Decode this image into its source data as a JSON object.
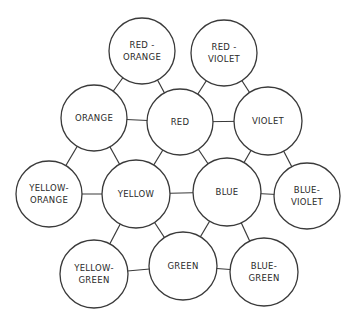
{
  "diagram": {
    "type": "color-wheel-hex-graph",
    "nodes": [
      {
        "id": "red-orange",
        "lines": [
          "RED -",
          "ORANGE"
        ],
        "cx": 142,
        "cy": 51,
        "r": 33
      },
      {
        "id": "red-violet",
        "lines": [
          "RED -",
          "VIOLET"
        ],
        "cx": 224,
        "cy": 53,
        "r": 33
      },
      {
        "id": "orange",
        "lines": [
          "ORANGE"
        ],
        "cx": 94,
        "cy": 118,
        "r": 33
      },
      {
        "id": "red",
        "lines": [
          "RED"
        ],
        "cx": 180,
        "cy": 122,
        "r": 33
      },
      {
        "id": "violet",
        "lines": [
          "VIOLET"
        ],
        "cx": 268,
        "cy": 121,
        "r": 34
      },
      {
        "id": "yellow-orange",
        "lines": [
          "YELLOW-",
          "ORANGE"
        ],
        "cx": 49,
        "cy": 194,
        "r": 33
      },
      {
        "id": "yellow",
        "lines": [
          "YELLOW"
        ],
        "cx": 136,
        "cy": 194,
        "r": 34
      },
      {
        "id": "blue",
        "lines": [
          "BLUE"
        ],
        "cx": 227,
        "cy": 192,
        "r": 34
      },
      {
        "id": "blue-violet",
        "lines": [
          "BLUE-",
          "VIOLET"
        ],
        "cx": 307,
        "cy": 196,
        "r": 33
      },
      {
        "id": "yellow-green",
        "lines": [
          "YELLOW-",
          "GREEN"
        ],
        "cx": 94,
        "cy": 274,
        "r": 34
      },
      {
        "id": "green",
        "lines": [
          "GREEN"
        ],
        "cx": 183,
        "cy": 266,
        "r": 34
      },
      {
        "id": "blue-green",
        "lines": [
          "BLUE-",
          "GREEN"
        ],
        "cx": 264,
        "cy": 272,
        "r": 34
      }
    ],
    "edges": [
      [
        "red-orange",
        "orange"
      ],
      [
        "red-orange",
        "red"
      ],
      [
        "red-violet",
        "red"
      ],
      [
        "red-violet",
        "violet"
      ],
      [
        "orange",
        "red"
      ],
      [
        "red",
        "violet"
      ],
      [
        "orange",
        "yellow-orange"
      ],
      [
        "orange",
        "yellow"
      ],
      [
        "red",
        "yellow"
      ],
      [
        "red",
        "blue"
      ],
      [
        "violet",
        "blue"
      ],
      [
        "violet",
        "blue-violet"
      ],
      [
        "yellow-orange",
        "yellow"
      ],
      [
        "yellow",
        "blue"
      ],
      [
        "blue",
        "blue-violet"
      ],
      [
        "yellow",
        "yellow-green"
      ],
      [
        "yellow",
        "green"
      ],
      [
        "blue",
        "green"
      ],
      [
        "blue",
        "blue-green"
      ],
      [
        "yellow-green",
        "green"
      ],
      [
        "green",
        "blue-green"
      ]
    ],
    "colors": {
      "stroke": "#3a3a3a",
      "text": "#2a2a2a",
      "background": "#ffffff"
    }
  }
}
